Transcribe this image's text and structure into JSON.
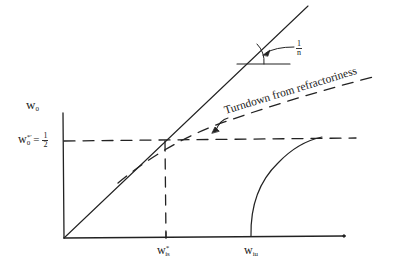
{
  "diagram": {
    "colors": {
      "ink": "#222222",
      "background": "#ffffff"
    },
    "y_axis_label": {
      "base": "w",
      "sub": "0"
    },
    "level_label": {
      "base": "w",
      "sup": "*′",
      "sub": "0",
      "eq": "=",
      "num": "1",
      "den": "2"
    },
    "slope_label": {
      "num": "1",
      "den": "n"
    },
    "turndown_label": "Turndown from refractoriness",
    "x_labels": [
      {
        "base": "w",
        "sup": "*",
        "sub": "is"
      },
      {
        "base": "w",
        "sub": "iu"
      }
    ],
    "geometry": {
      "origin": [
        64,
        238
      ],
      "y_axis_top": [
        63,
        113
      ],
      "x_axis_end": [
        344,
        236
      ],
      "diagonal_end": [
        308,
        6
      ],
      "level_y": 141,
      "wis_x": 165,
      "wiu_x": 251
    }
  }
}
